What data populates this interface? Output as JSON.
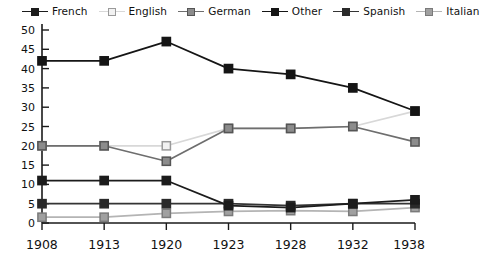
{
  "chart_data": {
    "type": "line",
    "title": "",
    "subtitle": "",
    "xlabel": "",
    "ylabel": "",
    "categories": [
      "1908",
      "1913",
      "1920",
      "1923",
      "1928",
      "1932",
      "1938"
    ],
    "x": [
      1908,
      1913,
      1920,
      1923,
      1928,
      1932,
      1938
    ],
    "ylim": [
      0,
      50
    ],
    "yticks": [
      0,
      5,
      10,
      15,
      20,
      25,
      30,
      35,
      40,
      45,
      50
    ],
    "ytick_labels": [
      "0",
      "5",
      "10",
      "15",
      "20",
      "25",
      "30",
      "35",
      "40",
      "45",
      "50"
    ],
    "grid": false,
    "legend_position": "top",
    "series": [
      {
        "name": "French",
        "values": [
          11,
          11,
          11,
          4.5,
          4,
          5,
          6
        ],
        "marker": "filled-square",
        "line_color": "#1c1c1c",
        "marker_color": "#1c1c1c",
        "marker_edge_color": "#1c1c1c"
      },
      {
        "name": "English",
        "values": [
          20,
          20,
          20,
          24.5,
          24.5,
          25,
          29
        ],
        "marker": "open-square",
        "line_color": "#d8d8d8",
        "marker_color": "#f2f2f2",
        "marker_edge_color": "#9a9a9a"
      },
      {
        "name": "German",
        "values": [
          20,
          20,
          16,
          24.5,
          24.5,
          25,
          21
        ],
        "marker": "filled-square",
        "line_color": "#6e6e6e",
        "marker_color": "#8c8c8c",
        "marker_edge_color": "#555555"
      },
      {
        "name": "Other",
        "values": [
          42,
          42,
          47,
          40,
          38.5,
          35,
          29
        ],
        "marker": "filled-square",
        "line_color": "#151515",
        "marker_color": "#151515",
        "marker_edge_color": "#151515"
      },
      {
        "name": "Spanish",
        "values": [
          5,
          5,
          5,
          5,
          4.5,
          5,
          5
        ],
        "marker": "filled-square",
        "line_color": "#343434",
        "marker_color": "#2a2a2a",
        "marker_edge_color": "#2a2a2a"
      },
      {
        "name": "Italian",
        "values": [
          1.5,
          1.5,
          2.5,
          3,
          3.2,
          3,
          4
        ],
        "marker": "filled-square",
        "line_color": "#b4b4b4",
        "marker_color": "#a0a0a0",
        "marker_edge_color": "#7a7a7a"
      }
    ]
  },
  "legend": {
    "items": [
      {
        "label": "French"
      },
      {
        "label": "English"
      },
      {
        "label": "German"
      },
      {
        "label": "Other"
      },
      {
        "label": "Spanish"
      },
      {
        "label": "Italian"
      }
    ]
  },
  "axes": {
    "axis_color": "#1a1a1a"
  }
}
